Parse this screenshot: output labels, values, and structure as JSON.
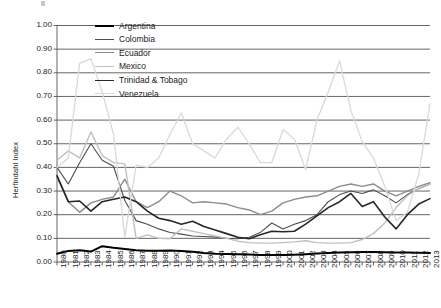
{
  "chart_data": {
    "type": "line",
    "title": "",
    "xlabel": "",
    "ylabel": "Herfindahl Index",
    "ylim": [
      0.0,
      1.0
    ],
    "ytick_step": 0.1,
    "ytick_labels": [
      "0.00",
      "0.10",
      "0.20",
      "0.30",
      "0.40",
      "0.50",
      "0.60",
      "0.70",
      "0.80",
      "0.90",
      "1.00"
    ],
    "grid": "horizontal",
    "legend_position": "inside-upper-left",
    "x": [
      1980,
      1981,
      1982,
      1983,
      1984,
      1985,
      1986,
      1987,
      1988,
      1989,
      1990,
      1991,
      1992,
      1993,
      1994,
      1995,
      1996,
      1997,
      1998,
      1999,
      2000,
      2001,
      2002,
      2003,
      2004,
      2005,
      2006,
      2007,
      2008,
      2009,
      2010,
      2011,
      2012,
      2013
    ],
    "xtick_labels": [
      "1980",
      "1981",
      "1982",
      "1983",
      "1984",
      "1985",
      "1986",
      "1987",
      "1988",
      "1989",
      "1990",
      "1991",
      "1992",
      "1993",
      "1994",
      "1995",
      "1996",
      "1997",
      "1998",
      "1999",
      "2000",
      "2001",
      "2002",
      "2003",
      "2004",
      "2005",
      "2006",
      "2007",
      "2008",
      "2009",
      "2010",
      "2011",
      "2012",
      "2013"
    ],
    "series": [
      {
        "name": "Argentina",
        "color": "#000000",
        "width": 2.0,
        "values": [
          0.035,
          0.047,
          0.05,
          0.044,
          0.067,
          0.06,
          0.055,
          0.05,
          0.048,
          0.048,
          0.049,
          0.046,
          0.043,
          0.038,
          0.035,
          0.034,
          0.033,
          0.032,
          0.03,
          0.03,
          0.03,
          0.031,
          0.033,
          0.036,
          0.038,
          0.04,
          0.041,
          0.042,
          0.042,
          0.041,
          0.04,
          0.04,
          0.039,
          0.038
        ]
      },
      {
        "name": "Colombia",
        "color": "#4d4d4d",
        "width": 1.1,
        "values": [
          0.4,
          0.33,
          0.42,
          0.5,
          0.43,
          0.405,
          0.26,
          0.175,
          0.16,
          0.14,
          0.125,
          0.118,
          0.11,
          0.108,
          0.105,
          0.1,
          0.098,
          0.105,
          0.125,
          0.165,
          0.14,
          0.16,
          0.175,
          0.2,
          0.255,
          0.285,
          0.3,
          0.29,
          0.305,
          0.28,
          0.25,
          0.285,
          0.31,
          0.33
        ]
      },
      {
        "name": "Ecuador",
        "color": "#8c8c8c",
        "width": 1.4,
        "values": [
          0.36,
          0.255,
          0.21,
          0.25,
          0.265,
          0.275,
          0.35,
          0.255,
          0.23,
          0.255,
          0.3,
          0.28,
          0.25,
          0.255,
          0.25,
          0.245,
          0.23,
          0.22,
          0.2,
          0.215,
          0.25,
          0.265,
          0.275,
          0.28,
          0.3,
          0.32,
          0.33,
          0.32,
          0.33,
          0.3,
          0.28,
          0.3,
          0.32,
          0.335
        ]
      },
      {
        "name": "Mexico",
        "color": "#c0c0c0",
        "width": 1.4,
        "values": [
          0.43,
          0.47,
          0.44,
          0.55,
          0.45,
          0.42,
          0.415,
          0.1,
          0.115,
          0.1,
          0.098,
          0.14,
          0.13,
          0.12,
          0.11,
          0.1,
          0.088,
          0.082,
          0.08,
          0.08,
          0.082,
          0.085,
          0.09,
          0.082,
          0.08,
          0.08,
          0.082,
          0.095,
          0.12,
          0.165,
          0.23,
          0.28,
          0.31,
          0.33
        ]
      },
      {
        "name": "Trinidad & Tobago",
        "color": "#262626",
        "width": 1.6,
        "values": [
          0.365,
          0.255,
          0.258,
          0.215,
          0.255,
          0.265,
          0.275,
          0.255,
          0.215,
          0.185,
          0.175,
          0.16,
          0.172,
          0.15,
          0.135,
          0.12,
          0.105,
          0.098,
          0.115,
          0.13,
          0.128,
          0.13,
          0.16,
          0.195,
          0.23,
          0.255,
          0.29,
          0.235,
          0.255,
          0.19,
          0.14,
          0.2,
          0.245,
          0.268
        ]
      },
      {
        "name": "Venezuela",
        "color": "#d9d9d9",
        "width": 1.3,
        "values": [
          0.4,
          0.44,
          0.84,
          0.86,
          0.72,
          0.54,
          0.105,
          0.41,
          0.4,
          0.44,
          0.54,
          0.63,
          0.5,
          0.47,
          0.44,
          0.52,
          0.57,
          0.5,
          0.42,
          0.42,
          0.56,
          0.52,
          0.39,
          0.6,
          0.72,
          0.85,
          0.64,
          0.51,
          0.44,
          0.32,
          0.175,
          0.21,
          0.37,
          0.67
        ]
      }
    ]
  },
  "axis": {
    "y_title": "Herfindahl Index"
  },
  "legend": {
    "entries": [
      {
        "label": "Argentina"
      },
      {
        "label": "Colombia"
      },
      {
        "label": "Ecuador"
      },
      {
        "label": "Mexico"
      },
      {
        "label": "Trinidad & Tobago"
      },
      {
        "label": "Venezuela"
      }
    ]
  }
}
